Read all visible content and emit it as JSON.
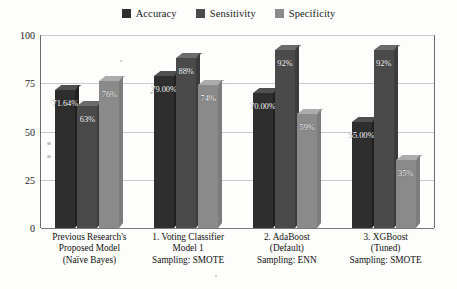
{
  "chart_data": {
    "type": "bar",
    "title": "",
    "xlabel": "",
    "ylabel": "",
    "ylim": [
      0,
      100
    ],
    "yticks": [
      0,
      25,
      50,
      75,
      100
    ],
    "ytick_labels": [
      "0",
      "25",
      "50",
      "75",
      "100"
    ],
    "grid": true,
    "legend_position": "top-center",
    "style": "3d-grouped-bar-grayscale",
    "categories": [
      "Previous Research's Proposed Model (Naïve Bayes)",
      "1. Voting Classifier Model 1 Sampling: SMOTE",
      "2. AdaBoost (Default) Sampling: ENN",
      "3. XGBoost (Tuned) Sampling: SMOTE"
    ],
    "category_lines": [
      [
        "Previous Research's",
        "Proposed Model",
        "(Naïve Bayes)"
      ],
      [
        "1. Voting Classifier",
        "Model 1",
        "Sampling: SMOTE"
      ],
      [
        "2. AdaBoost",
        "(Default)",
        "Sampling: ENN"
      ],
      [
        "3. XGBoost",
        "(Tuned)",
        "Sampling: SMOTE"
      ]
    ],
    "series": [
      {
        "name": "Accuracy",
        "color": "#2e2e2e",
        "values": [
          71.64,
          79.0,
          70.0,
          55.0
        ],
        "labels": [
          "71.64%",
          "79.00%",
          "70.00%",
          "55.00%"
        ]
      },
      {
        "name": "Sensitivity",
        "color": "#4a4a4a",
        "values": [
          63,
          88,
          92,
          92
        ],
        "labels": [
          "63%",
          "88%",
          "92%",
          "92%"
        ]
      },
      {
        "name": "Specificity",
        "color": "#8a8a8a",
        "values": [
          76,
          74,
          59,
          35
        ],
        "labels": [
          "76%",
          "74%",
          "59%",
          "35%"
        ]
      }
    ]
  },
  "legend": {
    "items": [
      {
        "label": "Accuracy",
        "color": "#2e2e2e"
      },
      {
        "label": "Sensitivity",
        "color": "#4a4a4a"
      },
      {
        "label": "Specificity",
        "color": "#8a8a8a"
      }
    ]
  },
  "axis": {
    "y_tick_labels": [
      "100",
      "75",
      "50",
      "25",
      "0"
    ]
  }
}
